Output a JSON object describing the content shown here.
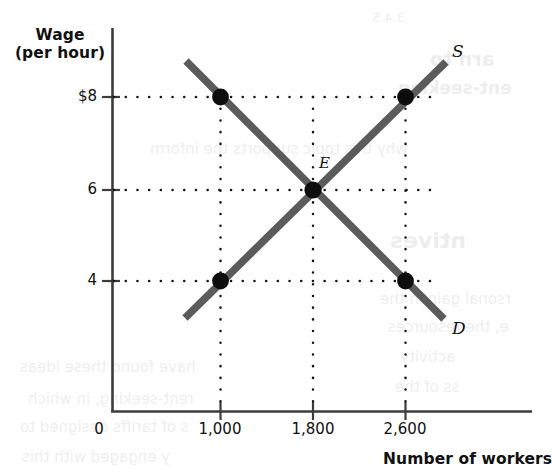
{
  "chart_data": {
    "type": "line",
    "title": "",
    "xlabel": "Number of workers",
    "ylabel": "Wage\n(per hour)",
    "ylabel_line1": "Wage",
    "ylabel_line2": "(per hour)",
    "origin_label": "0",
    "xticks": [
      "1,000",
      "1,800",
      "2,600"
    ],
    "xtick_values": [
      1000,
      1800,
      2600
    ],
    "yticks": [
      "$8",
      "6",
      "4"
    ],
    "ytick_values": [
      8,
      6,
      4
    ],
    "xlim": [
      0,
      3000
    ],
    "ylim": [
      0,
      10
    ],
    "grid": "dotted",
    "legend_position": "inline-curve-ends",
    "series": [
      {
        "name": "S",
        "label": "S",
        "description": "Labor supply curve, upward sloping",
        "color": "#5b5b5b",
        "x": [
          800,
          2850
        ],
        "y": [
          3.45,
          9.25
        ],
        "points": [
          {
            "x": 1000,
            "y": 4,
            "marker": "dot"
          },
          {
            "x": 1800,
            "y": 6,
            "marker": "dot"
          },
          {
            "x": 2600,
            "y": 8,
            "marker": "dot"
          }
        ]
      },
      {
        "name": "D",
        "label": "D",
        "description": "Labor demand curve, downward sloping",
        "color": "#5b5b5b",
        "x": [
          700,
          2840
        ],
        "y": [
          9.3,
          3.4
        ],
        "points": [
          {
            "x": 1000,
            "y": 8,
            "marker": "dot"
          },
          {
            "x": 1800,
            "y": 6,
            "marker": "dot"
          },
          {
            "x": 2600,
            "y": 4,
            "marker": "dot"
          }
        ]
      }
    ],
    "annotations": [
      {
        "label": "E",
        "x": 1800,
        "y": 6,
        "description": "Equilibrium point where supply equals demand"
      }
    ],
    "equilibrium": {
      "wage": 6,
      "workers": 1800,
      "label": "E"
    }
  },
  "bleed_text": [
    {
      "text": "3.4.5",
      "x": 372,
      "y": 10,
      "size": 13,
      "bold": false
    },
    {
      "text": "arn to",
      "x": 430,
      "y": 48,
      "size": 19,
      "bold": true
    },
    {
      "text": "ent-seeking",
      "x": 398,
      "y": 78,
      "size": 17,
      "bold": true
    },
    {
      "text": "why this topic supports the inform",
      "x": 150,
      "y": 140,
      "size": 15,
      "bold": false
    },
    {
      "text": "ntives",
      "x": 390,
      "y": 228,
      "size": 22,
      "bold": true
    },
    {
      "text": "rsonal gain in the",
      "x": 380,
      "y": 290,
      "size": 15,
      "bold": false
    },
    {
      "text": "e, the resources",
      "x": 388,
      "y": 318,
      "size": 15,
      "bold": false
    },
    {
      "text": "activity",
      "x": 400,
      "y": 348,
      "size": 15,
      "bold": false
    },
    {
      "text": "ss of the",
      "x": 395,
      "y": 378,
      "size": 15,
      "bold": false
    },
    {
      "text": "have  found  these  ideas",
      "x": 20,
      "y": 358,
      "size": 15,
      "bold": false
    },
    {
      "text": "rent-seeking,  in  which",
      "x": 28,
      "y": 390,
      "size": 15,
      "bold": false
    },
    {
      "text": "s  of  tariffs  designed  to",
      "x": 20,
      "y": 418,
      "size": 15,
      "bold": false
    },
    {
      "text": "y  engaged  with  this",
      "x": 22,
      "y": 448,
      "size": 15,
      "bold": false
    }
  ]
}
